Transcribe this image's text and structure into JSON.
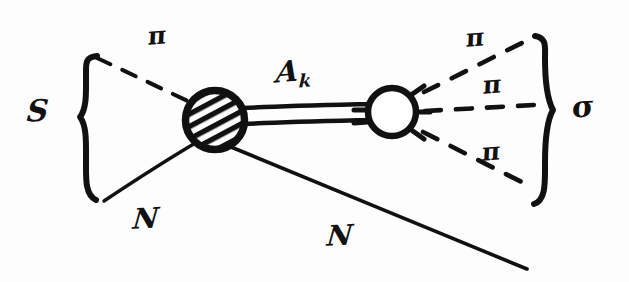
{
  "figure": {
    "background_color": "#fdfdfd",
    "ink_color": "#111111",
    "width": 629,
    "height": 282
  },
  "labels": {
    "incoming_pion": "π",
    "incoming_nucleon": "N",
    "outgoing_nucleon": "N",
    "propagator": "A",
    "propagator_subscript": "k",
    "outgoing_pion_top": "π",
    "outgoing_pion_middle": "π",
    "outgoing_pion_bottom": "π",
    "left_bracket_label": "S",
    "right_bracket_label": "σ"
  },
  "vertices": {
    "left_blob": {
      "name": "hatched-blob",
      "cx": 215,
      "cy": 120,
      "r": 31,
      "fill": "hatched"
    },
    "right_circle": {
      "name": "open-circle",
      "cx": 392,
      "cy": 112,
      "r": 26,
      "fill": "open"
    }
  },
  "lines": {
    "incoming_pion": {
      "style": "dashed",
      "x1": 97,
      "y1": 58,
      "x2": 192,
      "y2": 102
    },
    "incoming_nucleon": {
      "style": "solid",
      "x1": 104,
      "y1": 200,
      "x2": 196,
      "y2": 142
    },
    "propagator": {
      "style": "double",
      "x1": 246,
      "y1": 116,
      "x2": 366,
      "y2": 112
    },
    "outgoing_nucleon": {
      "style": "solid",
      "x1": 231,
      "y1": 146,
      "x2": 527,
      "y2": 268
    },
    "outgoing_pion_top": {
      "style": "dashed",
      "x1": 417,
      "y1": 96,
      "x2": 527,
      "y2": 40
    },
    "outgoing_pion_middle": {
      "style": "dashed",
      "x1": 419,
      "y1": 112,
      "x2": 533,
      "y2": 106
    },
    "outgoing_pion_bottom": {
      "style": "dashed",
      "x1": 417,
      "y1": 130,
      "x2": 531,
      "y2": 186
    }
  },
  "brackets": {
    "left": {
      "name": "left-curly-brace",
      "x": 85,
      "y_top": 55,
      "y_bottom": 202,
      "direction": "open-right"
    },
    "right": {
      "name": "right-curly-brace",
      "x": 545,
      "y_top": 35,
      "y_bottom": 206,
      "direction": "open-left"
    }
  }
}
